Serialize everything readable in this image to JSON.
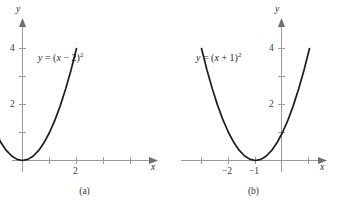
{
  "figure": {
    "type": "math-graph-figure",
    "background_color": "#ffffff",
    "curve_color": "#1c1c1c",
    "axis_color": "#9b9b9b",
    "text_color": "#2a2a2a"
  },
  "panels": [
    {
      "id": "a",
      "caption": "(a)",
      "equation": {
        "full": "y = (x − 2)²",
        "lhs": "y",
        "equals": "=",
        "open_paren": "(",
        "variable": "x",
        "operator": "−",
        "constant": "2",
        "close_paren": ")",
        "exponent": "2"
      },
      "x_axis_name": "x",
      "y_axis_name": "y",
      "x_tick_labels": [
        "2"
      ],
      "y_tick_labels": [
        "2",
        "4"
      ]
    },
    {
      "id": "b",
      "caption": "(b)",
      "equation": {
        "full": "y = (x + 1)²",
        "lhs": "y",
        "equals": "=",
        "open_paren": "(",
        "variable": "x",
        "operator": "+",
        "constant": "1",
        "close_paren": ")",
        "exponent": "2"
      },
      "x_axis_name": "x",
      "y_axis_name": "y",
      "x_tick_labels": [
        "−2",
        "−1"
      ],
      "y_tick_labels": [
        "2",
        "4"
      ]
    }
  ],
  "chart_data": [
    {
      "type": "line",
      "title": "y = (x − 2)²",
      "subtitle": "(a)",
      "xlabel": "x",
      "ylabel": "y",
      "xlim": [
        -0.35,
        4.75
      ],
      "ylim": [
        -0.55,
        5.0
      ],
      "grid": false,
      "legend": "none",
      "x_ticks": [
        0,
        1,
        2,
        3,
        4
      ],
      "x_tick_labels": [
        "",
        "",
        "2",
        "",
        ""
      ],
      "y_ticks": [
        1,
        2,
        3,
        4
      ],
      "y_tick_labels": [
        "",
        "2",
        "",
        "4"
      ],
      "vertex": [
        2,
        0
      ],
      "series": [
        {
          "name": "y = (x - 2)^2",
          "x": [
            0.0,
            0.2,
            0.4,
            0.6,
            0.8,
            1.0,
            1.2,
            1.4,
            1.6,
            1.8,
            2.0,
            2.2,
            2.4,
            2.6,
            2.8,
            3.0,
            3.2,
            3.4,
            3.6,
            3.8,
            4.0
          ],
          "values": [
            4.0,
            3.24,
            2.56,
            1.96,
            1.44,
            1.0,
            0.64,
            0.36,
            0.16,
            0.04,
            0.0,
            0.04,
            0.16,
            0.36,
            0.64,
            1.0,
            1.44,
            1.96,
            2.56,
            3.24,
            4.0
          ]
        }
      ],
      "annotations": [
        {
          "text": "y = (x − 2)²",
          "x": 0.75,
          "y": 3.25
        }
      ]
    },
    {
      "type": "line",
      "title": "y = (x + 1)²",
      "subtitle": "(b)",
      "xlabel": "x",
      "ylabel": "y",
      "xlim": [
        -3.4,
        1.75
      ],
      "ylim": [
        -0.55,
        5.0
      ],
      "grid": false,
      "legend": "none",
      "x_ticks": [
        -3,
        -2,
        -1,
        0,
        1
      ],
      "x_tick_labels": [
        "",
        "−2",
        "−1",
        "",
        ""
      ],
      "y_ticks": [
        1,
        2,
        3,
        4
      ],
      "y_tick_labels": [
        "",
        "2",
        "",
        "4"
      ],
      "vertex": [
        -1,
        0
      ],
      "series": [
        {
          "name": "y = (x + 1)^2",
          "x": [
            -3.0,
            -2.8,
            -2.6,
            -2.4,
            -2.2,
            -2.0,
            -1.8,
            -1.6,
            -1.4,
            -1.2,
            -1.0,
            -0.8,
            -0.6,
            -0.4,
            -0.2,
            0.0,
            0.2,
            0.4,
            0.6,
            0.8,
            1.0
          ],
          "values": [
            4.0,
            3.24,
            2.56,
            1.96,
            1.44,
            1.0,
            0.64,
            0.36,
            0.16,
            0.04,
            0.0,
            0.04,
            0.16,
            0.36,
            0.64,
            1.0,
            1.44,
            1.96,
            2.56,
            3.24,
            4.0
          ]
        }
      ],
      "annotations": [
        {
          "text": "y = (x + 1)²",
          "x": -2.25,
          "y": 3.25
        }
      ]
    }
  ]
}
